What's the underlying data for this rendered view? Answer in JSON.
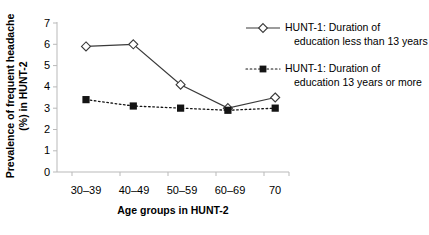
{
  "chart_data": {
    "type": "line",
    "title": "",
    "subtitle": "",
    "xlabel": "Age groups in HUNT-2",
    "ylabel": "Prevalence of frequent headache (%) in HUNT-2",
    "ylabel_line1": "Prevalence of frequent headache",
    "ylabel_line2": "(%) in HUNT-2",
    "categories": [
      "30–39",
      "40–49",
      "50–59",
      "60–69",
      "70"
    ],
    "series": [
      {
        "name": "HUNT-1: Duration of education less than 13 years",
        "name_line1": "HUNT-1: Duration of",
        "name_line2": "education less than 13 years",
        "values": [
          5.9,
          6.0,
          4.1,
          3.0,
          3.5
        ],
        "marker": "open-diamond",
        "linestyle": "solid",
        "color": "#3a3a3a"
      },
      {
        "name": "HUNT-1: Duration of education 13 years or more",
        "name_line1": "HUNT-1: Duration of",
        "name_line2": "education 13 years or more",
        "values": [
          3.4,
          3.1,
          3.0,
          2.9,
          3.0
        ],
        "marker": "filled-square",
        "linestyle": "dotted",
        "color": "#141414"
      }
    ],
    "ylim": [
      0,
      7
    ],
    "yticks": [
      "0",
      "1",
      "2",
      "3",
      "4",
      "5",
      "6",
      "7"
    ],
    "grid": false,
    "legend_position": "right"
  }
}
